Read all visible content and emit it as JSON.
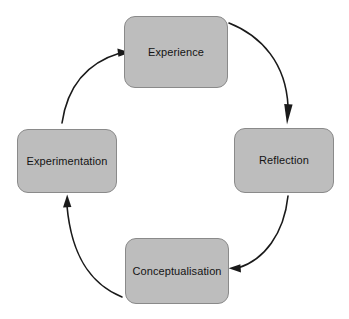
{
  "diagram": {
    "type": "cycle",
    "direction": "clockwise",
    "background_color": "#ffffff",
    "node_fill_color": "#bdbdbd",
    "node_border_color": "#8a8a8a",
    "arrow_color": "#1a1a1a",
    "text_color": "#141414",
    "nodes": [
      {
        "id": "experience",
        "label": "Experience",
        "position": "top"
      },
      {
        "id": "reflection",
        "label": "Reflection",
        "position": "right"
      },
      {
        "id": "conceptualisation",
        "label": "Conceptualisation",
        "position": "bottom"
      },
      {
        "id": "experimentation",
        "label": "Experimentation",
        "position": "left"
      }
    ],
    "edges": [
      {
        "from": "experience",
        "to": "reflection"
      },
      {
        "from": "reflection",
        "to": "conceptualisation"
      },
      {
        "from": "conceptualisation",
        "to": "experimentation"
      },
      {
        "from": "experimentation",
        "to": "experience"
      }
    ]
  }
}
